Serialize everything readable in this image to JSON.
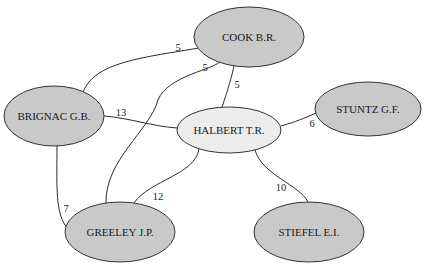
{
  "graph": {
    "type": "undirected-weighted-network",
    "colors": {
      "highlighted_fill": "#c9c9c9",
      "center_fill": "#ececec",
      "stroke": "#333333"
    },
    "nodes": [
      {
        "id": "cook",
        "label": "COOK B.R.",
        "cx": 249,
        "cy": 37,
        "rx": 55,
        "ry": 30,
        "fill": "#c9c9c9"
      },
      {
        "id": "brignac",
        "label": "BRIGNAC G.B.",
        "cx": 54,
        "cy": 116,
        "rx": 50,
        "ry": 30,
        "fill": "#c9c9c9"
      },
      {
        "id": "halbert",
        "label": "HALBERT T.R.",
        "cx": 229,
        "cy": 130,
        "rx": 52,
        "ry": 23,
        "fill": "#ececec"
      },
      {
        "id": "stuntz",
        "label": "STUNTZ G.F.",
        "cx": 368,
        "cy": 109,
        "rx": 53,
        "ry": 27,
        "fill": "#c9c9c9"
      },
      {
        "id": "greeley",
        "label": "GREELEY J.P.",
        "cx": 120,
        "cy": 232,
        "rx": 55,
        "ry": 30,
        "fill": "#c9c9c9"
      },
      {
        "id": "stiefel",
        "label": "STIEFEL E.I.",
        "cx": 309,
        "cy": 232,
        "rx": 55,
        "ry": 30,
        "fill": "#c9c9c9"
      }
    ],
    "edges": [
      {
        "source": "brignac",
        "target": "cook",
        "weight": "5",
        "path": "M 83 92 C 95 62, 140 58, 205 47",
        "label_x": 178,
        "label_y": 47
      },
      {
        "source": "greeley",
        "target": "cook",
        "weight": "5",
        "path": "M 106 203 C 105 160, 150 130, 158 100 C 168 75, 215 70, 222 60",
        "label_x": 205,
        "label_y": 67
      },
      {
        "source": "halbert",
        "target": "cook",
        "weight": "5",
        "path": "M 222 107 C 228 90, 232 75, 234 66",
        "label_x": 237,
        "label_y": 84
      },
      {
        "source": "brignac",
        "target": "halbert",
        "weight": "13",
        "path": "M 104 116 C 130 118, 150 126, 177 128",
        "label_x": 121,
        "label_y": 112
      },
      {
        "source": "halbert",
        "target": "stuntz",
        "weight": "6",
        "path": "M 281 126 C 295 122, 305 118, 316 113",
        "label_x": 312,
        "label_y": 123
      },
      {
        "source": "brignac",
        "target": "greeley",
        "weight": "7",
        "path": "M 57 146 C 57 180, 55 210, 65 225 C 72 232, 80 233, 86 232",
        "label_x": 66,
        "label_y": 208
      },
      {
        "source": "halbert",
        "target": "greeley",
        "weight": "12",
        "path": "M 199 149 C 195 175, 150 180, 134 203",
        "label_x": 158,
        "label_y": 196
      },
      {
        "source": "halbert",
        "target": "stiefel",
        "weight": "10",
        "path": "M 255 150 C 262 175, 300 185, 308 202",
        "label_x": 281,
        "label_y": 187
      }
    ]
  }
}
